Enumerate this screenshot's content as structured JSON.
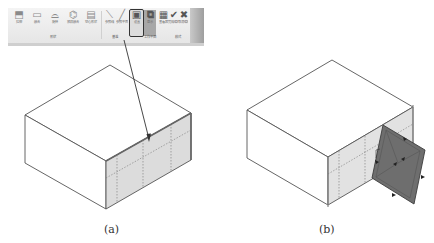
{
  "ribbon": {
    "panels": [
      {
        "label": "形状",
        "tools": [
          {
            "label": "拉伸",
            "icon": "extrusion-icon"
          },
          {
            "label": "融合",
            "icon": "blend-icon"
          },
          {
            "label": "旋转",
            "icon": "revolve-icon"
          },
          {
            "label": "放样融合",
            "icon": "swept-blend-icon"
          },
          {
            "label": "空心形状",
            "icon": "void-form-icon"
          }
        ]
      },
      {
        "label": "基准",
        "tools": [
          {
            "label": "参照线",
            "icon": "reference-line-icon"
          },
          {
            "label": "参照平面",
            "icon": "reference-plane-icon"
          }
        ]
      },
      {
        "label": "工作平面",
        "tools": [
          {
            "label": "设置",
            "icon": "set-workplane-icon",
            "highlighted": true
          },
          {
            "label": "显示",
            "icon": "show-workplane-icon",
            "active": true
          },
          {
            "label": "查看器",
            "icon": "viewer-icon"
          }
        ]
      },
      {
        "label": "模式",
        "tools": [
          {
            "label": "完成编辑",
            "icon": "finish-edit-icon"
          },
          {
            "label": "取消编辑",
            "icon": "cancel-edit-icon"
          }
        ]
      }
    ]
  },
  "figures": {
    "a": {
      "caption": "(a)"
    },
    "b": {
      "caption": "(b)"
    }
  },
  "colors": {
    "line": "#555555",
    "shaded_face": "#dcdcdc",
    "work_plane": "#6e6e6e"
  }
}
